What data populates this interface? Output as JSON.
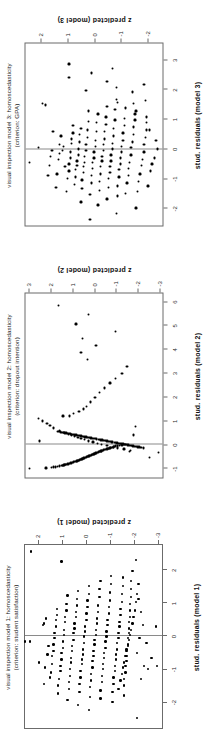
{
  "figure": {
    "background": "#ffffff",
    "orientation": "rotated-90-ccw",
    "point_color": "#000000",
    "frame_color": "#6b6b6b",
    "reference_line_color": "#8a8a8a",
    "panel_count": 3
  },
  "chart_data": [
    {
      "id": "panel-3",
      "type": "scatter",
      "title": "visual inspection model 3: homoscedasticity",
      "subtitle": "(criterion: GPA)",
      "xlabel": "stud. residuals (model 3)",
      "ylabel": "z predicted (model 3)",
      "xlim": [
        -2.6,
        3.6
      ],
      "ylim": [
        -2.6,
        2.6
      ],
      "xticks": [
        -2,
        -1,
        0,
        1,
        2,
        3
      ],
      "xticklabels": [
        "-2",
        "-1",
        "0",
        "1",
        "2",
        "3"
      ],
      "yticks": [
        -2,
        -1,
        0,
        1,
        2
      ],
      "yticklabels": [
        "-2",
        "-1",
        "0",
        "1",
        "2"
      ],
      "grid": false,
      "reference_line_x": 0,
      "n_points": 150,
      "x": [
        -0.45,
        0.05,
        1.55,
        1.5,
        -0.9,
        -0.55,
        -0.25,
        -0.05,
        0.6,
        -1.3,
        -0.85,
        -0.35,
        -0.15,
        0.15,
        0.45,
        -0.05,
        0.1,
        -0.6,
        -1.45,
        -1.0,
        -0.75,
        -0.5,
        -0.3,
        -0.1,
        0.2,
        0.35,
        0.55,
        0.8,
        -1.2,
        -0.95,
        -0.7,
        -0.55,
        -0.4,
        -0.2,
        0.0,
        0.25,
        0.5,
        0.7,
        2.45,
        2.9,
        -1.8,
        -1.35,
        -1.05,
        -0.8,
        -0.6,
        -0.45,
        -0.25,
        -0.05,
        0.15,
        0.4,
        0.65,
        0.95,
        1.3,
        -2.4,
        -1.55,
        -1.15,
        -0.9,
        -0.65,
        -0.45,
        -0.3,
        -0.1,
        0.1,
        0.3,
        0.6,
        0.9,
        1.2,
        2.0,
        2.6,
        -1.9,
        -1.4,
        -1.1,
        -0.85,
        -0.6,
        -0.4,
        -0.25,
        -0.05,
        0.15,
        0.35,
        0.6,
        0.85,
        1.1,
        1.45,
        -1.7,
        -1.3,
        -1.0,
        -0.8,
        -0.6,
        -0.4,
        -0.2,
        0.0,
        0.2,
        0.45,
        0.7,
        1.0,
        1.35,
        1.7,
        -2.2,
        -1.6,
        -1.25,
        -0.95,
        -0.7,
        -0.5,
        -0.3,
        -0.1,
        0.1,
        0.3,
        0.55,
        0.8,
        1.05,
        1.4,
        2.3,
        -1.5,
        -1.15,
        -0.9,
        -0.65,
        -0.45,
        -0.2,
        0.05,
        0.25,
        0.5,
        0.75,
        1.0,
        1.3,
        1.6,
        2.1,
        2.75,
        -2.0,
        -1.45,
        -1.1,
        -0.85,
        -0.55,
        -0.35,
        -0.1,
        0.15,
        0.4,
        0.65,
        0.9,
        1.2,
        1.55,
        1.95,
        -1.25,
        -0.75,
        -0.5,
        -0.3,
        0.0,
        0.3,
        0.65,
        1.1,
        1.65,
        2.2
      ],
      "y": [
        2.45,
        2.1,
        1.95,
        1.85,
        1.75,
        1.7,
        1.65,
        1.6,
        1.55,
        1.45,
        1.4,
        1.35,
        1.3,
        1.3,
        1.25,
        1.2,
        1.15,
        1.1,
        1.05,
        1.0,
        0.95,
        0.95,
        0.9,
        0.9,
        0.85,
        0.85,
        0.8,
        0.8,
        0.75,
        0.7,
        0.7,
        0.65,
        0.65,
        0.6,
        0.6,
        0.55,
        0.55,
        0.5,
        0.95,
        0.95,
        0.5,
        0.45,
        0.45,
        0.4,
        0.4,
        0.35,
        0.35,
        0.3,
        0.3,
        0.25,
        0.25,
        0.2,
        0.2,
        0.15,
        0.15,
        0.1,
        0.1,
        0.05,
        0.05,
        0.0,
        0.0,
        -0.05,
        -0.05,
        -0.1,
        -0.1,
        -0.15,
        0.3,
        0.1,
        -0.15,
        -0.2,
        -0.2,
        -0.25,
        -0.25,
        -0.3,
        -0.3,
        -0.35,
        -0.35,
        -0.4,
        -0.4,
        -0.45,
        -0.45,
        -0.5,
        -0.5,
        -0.55,
        -0.55,
        -0.6,
        -0.6,
        -0.65,
        -0.65,
        -0.7,
        -0.7,
        -0.75,
        -0.75,
        -0.8,
        -0.8,
        -0.85,
        -0.85,
        -0.9,
        -0.9,
        -0.95,
        -0.95,
        -1.0,
        -1.0,
        -1.05,
        -1.05,
        -1.1,
        -1.1,
        -1.15,
        -1.15,
        -1.2,
        -0.5,
        -1.2,
        -1.25,
        -1.3,
        -1.3,
        -1.35,
        -1.4,
        -1.4,
        -1.45,
        -1.5,
        -1.5,
        -1.55,
        -1.6,
        -0.9,
        -0.85,
        -0.7,
        -1.6,
        -1.65,
        -1.7,
        -1.75,
        -1.8,
        -1.85,
        -1.9,
        -1.9,
        -1.95,
        -2.0,
        -2.0,
        -1.55,
        -1.5,
        -1.45,
        -2.05,
        -2.15,
        -2.2,
        -2.3,
        -2.4,
        -2.35,
        -2.1,
        -2.0,
        -1.95,
        -1.9
      ]
    },
    {
      "id": "panel-2",
      "type": "scatter",
      "title": "visual inspection model 2: homoscedasticity",
      "subtitle": "(criterion: dropout intention)",
      "xlabel": "stud. residuals (model 2)",
      "ylabel": "z predicted (model 2)",
      "xlim": [
        -1.4,
        6.4
      ],
      "ylim": [
        -3.2,
        3.2
      ],
      "xticks": [
        -1,
        0,
        1,
        2,
        3,
        4,
        5,
        6
      ],
      "xticklabels": [
        "-1",
        "0",
        "1",
        "2",
        "3",
        "4",
        "5",
        "6"
      ],
      "yticks": [
        -3,
        -2,
        -1,
        0,
        1,
        2,
        3
      ],
      "yticklabels": [
        "-3",
        "-2",
        "-1",
        "0",
        "1",
        "2",
        "3"
      ],
      "grid": false,
      "reference_line_x": 0,
      "n_points": 120,
      "note": "Dense near-linear band of residuals for the negative class plus a scattered positive-class cloud",
      "x": [
        -1.02,
        -1.0,
        -0.98,
        -0.96,
        -0.95,
        -0.93,
        -0.92,
        -0.9,
        -0.89,
        -0.87,
        -0.86,
        -0.85,
        -0.83,
        -0.82,
        -0.8,
        -0.79,
        -0.78,
        -0.76,
        -0.75,
        -0.73,
        -0.72,
        -0.7,
        -0.69,
        -0.67,
        -0.66,
        -0.64,
        -0.63,
        -0.61,
        -0.6,
        -0.58,
        -0.57,
        -0.55,
        -0.54,
        -0.52,
        -0.51,
        -0.49,
        -0.48,
        -0.46,
        -0.45,
        -0.43,
        -0.42,
        -0.4,
        -0.39,
        -0.37,
        -0.36,
        -0.34,
        -0.33,
        -0.31,
        -0.3,
        -0.28,
        -0.27,
        -0.25,
        -0.24,
        -0.22,
        -0.21,
        -0.19,
        -0.18,
        -0.16,
        -0.15,
        -0.13,
        -0.12,
        -0.1,
        -0.09,
        -0.07,
        -0.06,
        -0.04,
        -0.03,
        -0.01,
        0.0,
        -0.55,
        -0.35,
        -0.3,
        -0.25,
        -0.2,
        -0.15,
        -0.1,
        -0.05,
        0.0,
        0.05,
        0.1,
        0.15,
        0.2,
        0.25,
        0.3,
        0.35,
        0.4,
        0.45,
        0.5,
        0.6,
        0.7,
        0.8,
        0.9,
        1.0,
        1.1,
        1.2,
        1.3,
        1.4,
        1.5,
        1.6,
        1.8,
        2.0,
        2.2,
        2.4,
        2.6,
        2.8,
        3.0,
        3.3,
        3.6,
        3.9,
        4.2,
        4.5,
        4.8,
        5.1,
        5.5,
        5.9,
        0.15,
        0.4,
        0.75,
        1.2
      ],
      "y": [
        3.0,
        2.25,
        2.0,
        1.9,
        1.8,
        1.7,
        1.6,
        1.5,
        1.45,
        1.4,
        1.35,
        1.3,
        1.25,
        1.2,
        1.15,
        1.1,
        1.05,
        1.0,
        0.95,
        0.9,
        0.85,
        0.8,
        0.75,
        0.72,
        0.68,
        0.64,
        0.6,
        0.56,
        0.52,
        0.48,
        0.44,
        0.4,
        0.36,
        0.32,
        0.28,
        0.24,
        0.2,
        0.16,
        0.12,
        0.08,
        0.04,
        0.0,
        -0.04,
        -0.08,
        -0.12,
        -0.16,
        -0.2,
        -0.24,
        -0.28,
        -0.32,
        -0.36,
        -0.4,
        -0.45,
        -0.5,
        -0.55,
        -0.6,
        -0.65,
        -0.7,
        -0.75,
        -0.8,
        -0.85,
        -0.9,
        -0.95,
        -1.0,
        -1.1,
        -1.2,
        -1.3,
        -1.45,
        -1.6,
        -2.6,
        -3.0,
        -1.65,
        -1.7,
        -1.4,
        -1.1,
        -0.9,
        -0.6,
        -0.35,
        -0.15,
        0.05,
        0.25,
        0.45,
        0.6,
        0.75,
        0.9,
        1.05,
        1.2,
        1.4,
        1.6,
        1.9,
        2.05,
        2.2,
        2.4,
        2.6,
        1.15,
        0.95,
        0.7,
        0.5,
        0.35,
        0.15,
        -0.05,
        -0.25,
        -0.5,
        -0.75,
        -1.0,
        -1.3,
        -1.55,
        0.3,
        0.6,
        -0.1,
        0.55,
        -1.0,
        0.85,
        0.25,
        1.65,
        2.55,
        -1.85,
        -1.95,
        1.45,
        -1.05
      ],
      "dense_band": {
        "description": "near-vertical dense line of points just right of x=0, slope steep positive",
        "x_from": -0.15,
        "x_to": 0.55,
        "y_from": -2.3,
        "y_to": 1.7,
        "count": 60
      }
    },
    {
      "id": "panel-1",
      "type": "scatter",
      "title": "visual inspection model 1: homoscedasticity",
      "subtitle": "(criterion: student satisfaction)",
      "xlabel": "stud. residuals (model 1)",
      "ylabel": "z predicted (model 1)",
      "xlim": [
        -2.8,
        2.8
      ],
      "ylim": [
        -3.2,
        2.6
      ],
      "xticks": [
        -2,
        -1,
        0,
        1,
        2
      ],
      "xticklabels": [
        "-2",
        "-1",
        "0",
        "1",
        "2"
      ],
      "yticks": [
        -3,
        -2,
        -1,
        0,
        1,
        2
      ],
      "yticklabels": [
        "-3",
        "-2",
        "-1",
        "0",
        "1",
        "2"
      ],
      "grid": false,
      "reference_line_x": 0,
      "n_points": 190,
      "x": [
        -0.15,
        2.6,
        -0.8,
        -1.45,
        -0.95,
        -0.55,
        -0.3,
        0.35,
        0.4,
        0.55,
        -1.25,
        -1.1,
        -0.85,
        -0.6,
        -0.45,
        -0.25,
        -0.05,
        0.1,
        0.3,
        0.5,
        0.65,
        0.85,
        -1.75,
        -1.5,
        -1.3,
        -1.05,
        -0.9,
        -0.7,
        -0.5,
        -0.35,
        -0.15,
        0.05,
        0.2,
        0.45,
        0.6,
        0.8,
        1.0,
        1.25,
        -1.95,
        -1.6,
        -1.4,
        -1.2,
        -1.0,
        -0.8,
        -0.65,
        -0.45,
        -0.3,
        -0.1,
        0.1,
        0.25,
        0.4,
        0.6,
        0.75,
        0.95,
        1.15,
        1.4,
        2.3,
        -2.1,
        -1.7,
        -1.45,
        -1.25,
        -1.05,
        -0.85,
        -0.7,
        -0.55,
        -0.4,
        -0.2,
        0.0,
        0.15,
        0.3,
        0.5,
        0.7,
        0.9,
        1.1,
        1.3,
        1.55,
        -2.25,
        -1.85,
        -1.55,
        -1.35,
        -1.15,
        -0.95,
        -0.75,
        -0.6,
        -0.45,
        -0.25,
        -0.1,
        0.05,
        0.2,
        0.4,
        0.55,
        0.75,
        0.95,
        1.2,
        1.45,
        1.7,
        -1.9,
        -1.65,
        -1.4,
        -1.2,
        -1.0,
        -0.85,
        -0.65,
        -0.5,
        -0.35,
        -0.15,
        0.0,
        0.15,
        0.35,
        0.5,
        0.7,
        0.9,
        1.1,
        1.35,
        1.6,
        1.85,
        -2.0,
        -1.7,
        -1.45,
        -1.25,
        -1.05,
        -0.9,
        -0.7,
        -0.55,
        -0.4,
        -0.2,
        -0.05,
        0.1,
        0.3,
        0.45,
        0.65,
        0.85,
        1.05,
        1.3,
        1.55,
        1.8,
        -1.8,
        -1.5,
        -1.3,
        -1.1,
        -0.9,
        -0.75,
        -0.6,
        -0.4,
        -0.25,
        -0.05,
        0.1,
        0.25,
        0.45,
        0.6,
        0.8,
        1.0,
        1.2,
        1.45,
        1.7,
        2.0,
        -1.6,
        -1.35,
        -1.15,
        -0.95,
        -0.8,
        -0.6,
        -0.45,
        -0.3,
        -0.1,
        0.05,
        0.2,
        0.4,
        0.6,
        0.8,
        1.05,
        1.3,
        1.6,
        -2.5,
        -1.3,
        -0.9,
        -0.5,
        -0.05,
        0.35,
        0.75,
        1.15,
        2.35,
        -1.0,
        -0.65,
        -0.2,
        0.3,
        -0.9,
        -0.15
      ],
      "y": [
        2.4,
        2.35,
        2.0,
        1.8,
        1.75,
        1.65,
        1.6,
        1.85,
        1.8,
        1.7,
        1.55,
        1.5,
        1.45,
        1.45,
        1.4,
        1.4,
        1.35,
        1.35,
        1.3,
        1.3,
        1.25,
        1.25,
        1.2,
        1.2,
        1.15,
        1.1,
        1.1,
        1.05,
        1.05,
        1.0,
        1.0,
        0.95,
        0.95,
        0.9,
        0.9,
        0.85,
        0.85,
        0.8,
        0.8,
        0.75,
        0.75,
        0.7,
        0.7,
        0.65,
        0.65,
        0.6,
        0.6,
        0.55,
        0.55,
        0.5,
        0.5,
        0.45,
        0.45,
        0.4,
        0.4,
        0.35,
        1.05,
        0.35,
        0.3,
        0.3,
        0.25,
        0.25,
        0.2,
        0.2,
        0.15,
        0.15,
        0.1,
        0.1,
        0.05,
        0.05,
        0.0,
        0.0,
        -0.05,
        -0.05,
        -0.1,
        -0.1,
        -0.1,
        -0.15,
        -0.15,
        -0.2,
        -0.2,
        -0.25,
        -0.25,
        -0.3,
        -0.3,
        -0.35,
        -0.35,
        -0.4,
        -0.4,
        -0.45,
        -0.45,
        -0.5,
        -0.5,
        -0.55,
        -0.55,
        -0.6,
        -0.6,
        -0.6,
        -0.65,
        -0.65,
        -0.7,
        -0.7,
        -0.75,
        -0.75,
        -0.8,
        -0.8,
        -0.85,
        -0.85,
        -0.9,
        -0.9,
        -0.95,
        -0.95,
        -1.0,
        -1.0,
        -1.05,
        -1.05,
        -1.1,
        -1.1,
        -1.15,
        -1.15,
        -1.2,
        -1.2,
        -1.25,
        -1.25,
        -1.3,
        -1.3,
        -1.35,
        -1.35,
        -1.4,
        -1.4,
        -1.45,
        -1.45,
        -1.5,
        -1.5,
        -1.55,
        -1.55,
        -1.6,
        -1.6,
        -1.6,
        -1.65,
        -1.65,
        -1.7,
        -1.7,
        -1.7,
        -1.75,
        -1.75,
        -1.8,
        -1.8,
        -1.8,
        -1.85,
        -1.85,
        -1.85,
        -1.9,
        -1.9,
        -1.9,
        -1.95,
        -1.35,
        -1.45,
        -1.5,
        -1.55,
        -1.6,
        -1.65,
        -1.7,
        -1.75,
        -1.8,
        -1.85,
        -1.9,
        -1.95,
        -2.0,
        -2.05,
        -2.1,
        -2.15,
        -2.2,
        -2.15,
        -2.3,
        -2.45,
        -2.15,
        -2.25,
        -2.4,
        -2.3,
        -2.2,
        -2.1,
        -2.6,
        -2.75,
        -2.55,
        -2.95,
        -3.0
      ]
    }
  ]
}
